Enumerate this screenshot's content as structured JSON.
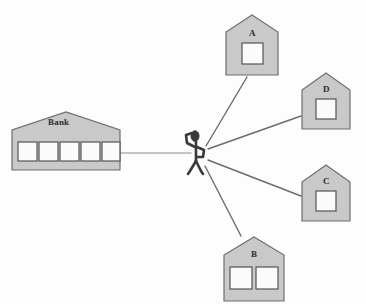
{
  "diagram": {
    "background_color": "#fdfdfd",
    "building_fill": "#c9c9c9",
    "building_stroke": "#6e6e6e",
    "window_fill": "#fbfbfb",
    "window_stroke": "#5e5e5e",
    "line_color": "#6b6b6b",
    "figure_color": "#3a3a3a"
  },
  "bank": {
    "label": "Bank",
    "window_count": 5,
    "x": 12,
    "y": 112,
    "width": 108,
    "height": 58,
    "roof_height": 18,
    "label_x": 48,
    "label_y": 120
  },
  "person": {
    "name": "person",
    "x": 192,
    "y": 131,
    "height": 42
  },
  "houses": [
    {
      "label": "A",
      "window_count": 1,
      "x": 226,
      "y": 15,
      "width": 52,
      "height": 60,
      "roof_height": 22,
      "label_x": 248,
      "label_y": 28
    },
    {
      "label": "D",
      "window_count": 1,
      "x": 302,
      "y": 73,
      "width": 48,
      "height": 56,
      "roof_height": 20,
      "label_x": 322,
      "label_y": 85
    },
    {
      "label": "C",
      "window_count": 1,
      "x": 302,
      "y": 165,
      "width": 48,
      "height": 56,
      "roof_height": 20,
      "label_x": 322,
      "label_y": 177
    },
    {
      "label": "B",
      "window_count": 2,
      "x": 224,
      "y": 237,
      "width": 60,
      "height": 64,
      "roof_height": 23,
      "label_x": 251,
      "label_y": 248
    }
  ],
  "connections": [
    {
      "from": "bank",
      "to": "person",
      "type": "horizontal"
    },
    {
      "from": "person",
      "to": "A",
      "type": "radial"
    },
    {
      "from": "person",
      "to": "D",
      "type": "radial"
    },
    {
      "from": "person",
      "to": "C",
      "type": "radial"
    },
    {
      "from": "person",
      "to": "B",
      "type": "radial"
    }
  ]
}
